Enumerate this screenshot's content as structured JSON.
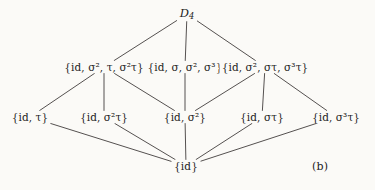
{
  "figure": {
    "caption": "(b)",
    "title_node": "D4",
    "background_color": "#fbfaf7",
    "line_color": "#555150"
  },
  "nodes": {
    "top": {
      "id": "D4",
      "label": "D_4",
      "base": "D",
      "subscript": "4",
      "x": 187,
      "y": 14
    },
    "middle": [
      {
        "id": "m1",
        "label": "{id, σ², τ, σ²τ}",
        "x": 104,
        "y": 67
      },
      {
        "id": "m2",
        "label": "{id, σ, σ², σ³}",
        "x": 185,
        "y": 67
      },
      {
        "id": "m3",
        "label": "{id, σ², στ, σ³τ}",
        "x": 265,
        "y": 67
      }
    ],
    "lower": [
      {
        "id": "l1",
        "label": "{id, τ}",
        "x": 30,
        "y": 117
      },
      {
        "id": "l2",
        "label": "{id, σ²τ}",
        "x": 104,
        "y": 117
      },
      {
        "id": "l3",
        "label": "{id, σ²}",
        "x": 185,
        "y": 117
      },
      {
        "id": "l4",
        "label": "{id, στ}",
        "x": 262,
        "y": 117
      },
      {
        "id": "l5",
        "label": "{id, σ³τ}",
        "x": 336,
        "y": 117
      }
    ],
    "bottom": {
      "id": "triv",
      "label": "{id}",
      "x": 186,
      "y": 166
    }
  },
  "edges": [
    {
      "from": "D4",
      "to": "m1"
    },
    {
      "from": "D4",
      "to": "m2"
    },
    {
      "from": "D4",
      "to": "m3"
    },
    {
      "from": "m1",
      "to": "l1"
    },
    {
      "from": "m1",
      "to": "l2"
    },
    {
      "from": "m1",
      "to": "l3"
    },
    {
      "from": "m2",
      "to": "l3"
    },
    {
      "from": "m3",
      "to": "l3"
    },
    {
      "from": "m3",
      "to": "l4"
    },
    {
      "from": "m3",
      "to": "l5"
    },
    {
      "from": "l1",
      "to": "triv"
    },
    {
      "from": "l2",
      "to": "triv"
    },
    {
      "from": "l3",
      "to": "triv"
    },
    {
      "from": "l4",
      "to": "triv"
    },
    {
      "from": "l5",
      "to": "triv"
    }
  ],
  "chart_data": {
    "type": "diagram",
    "diagram_kind": "hasse-lattice",
    "caption": "(b)",
    "levels": [
      {
        "rank": 3,
        "members": [
          "D_4"
        ]
      },
      {
        "rank": 2,
        "members": [
          "{id, σ², τ, σ²τ}",
          "{id, σ, σ², σ³}",
          "{id, σ², στ, σ³τ}"
        ]
      },
      {
        "rank": 1,
        "members": [
          "{id, τ}",
          "{id, σ²τ}",
          "{id, σ²}",
          "{id, στ}",
          "{id, σ³τ}"
        ]
      },
      {
        "rank": 0,
        "members": [
          "{id}"
        ]
      }
    ],
    "edge_count": 15,
    "node_count": 10
  }
}
